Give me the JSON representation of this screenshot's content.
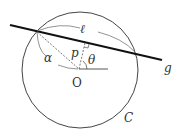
{
  "diagram": {
    "labels": {
      "ell": "ℓ",
      "g": "g",
      "p": "p",
      "theta": "θ",
      "alpha": "α",
      "origin": "O",
      "circle": "C"
    },
    "geometry": {
      "circle": {
        "cx": 80,
        "cy": 69,
        "r": 58
      },
      "line_g": {
        "x1": 10,
        "y1": 25,
        "x2": 162,
        "y2": 60
      },
      "intersection_left": {
        "x": 37,
        "y": 32
      },
      "intersection_right": {
        "x": 135,
        "y": 53
      },
      "foot_of_perpendicular": {
        "x": 85,
        "y": 43
      },
      "origin_point": {
        "x": 79,
        "y": 69
      }
    },
    "colors": {
      "stroke": "#333333",
      "line_g": "#111111"
    }
  }
}
